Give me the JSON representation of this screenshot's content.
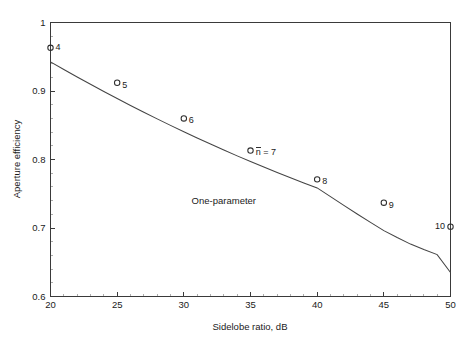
{
  "chart_data": {
    "type": "scatter",
    "title": "",
    "xlabel": "Sidelobe ratio, dB",
    "ylabel": "Aperture efficiency",
    "xlim": [
      20,
      50
    ],
    "ylim": [
      0.6,
      1.0
    ],
    "grid": false,
    "legend": "none",
    "x_ticks": [
      {
        "value": 20,
        "label": "20"
      },
      {
        "value": 25,
        "label": "25"
      },
      {
        "value": 30,
        "label": "30"
      },
      {
        "value": 35,
        "label": "35"
      },
      {
        "value": 40,
        "label": "40"
      },
      {
        "value": 45,
        "label": "45"
      },
      {
        "value": 50,
        "label": "50"
      }
    ],
    "y_ticks": [
      {
        "value": 0.6,
        "label": "0.6"
      },
      {
        "value": 0.7,
        "label": "0.7"
      },
      {
        "value": 0.8,
        "label": "0.8"
      },
      {
        "value": 0.9,
        "label": "0.9"
      },
      {
        "value": 1.0,
        "label": "1"
      }
    ],
    "x_minor_tick_step": 1,
    "y_minor_tick_step": 0.02,
    "series": [
      {
        "name": "Taylor n-bar designs",
        "type": "scatter",
        "marker": "open-circle",
        "x": [
          20,
          25,
          30,
          35,
          40,
          45,
          50
        ],
        "values": [
          0.963,
          0.912,
          0.86,
          0.813,
          0.771,
          0.737,
          0.702
        ],
        "point_labels": [
          "4",
          "5",
          "6",
          "7",
          "8",
          "9",
          "10"
        ],
        "point_label_positions": [
          "right",
          "right",
          "right",
          "right",
          "right",
          "right",
          "left"
        ]
      },
      {
        "name": "One-parameter",
        "type": "line",
        "marker": "none",
        "x": [
          20,
          21,
          22,
          23,
          24,
          25,
          26,
          27,
          28,
          29,
          30,
          31,
          32,
          33,
          34,
          35,
          36,
          37,
          38,
          39,
          40,
          41,
          42,
          43,
          44,
          45,
          46,
          47,
          48,
          49,
          50
        ],
        "values": [
          0.9425,
          0.9314,
          0.9205,
          0.9098,
          0.8993,
          0.889,
          0.8789,
          0.869,
          0.8593,
          0.8498,
          0.8405,
          0.8314,
          0.8225,
          0.8138,
          0.8053,
          0.797,
          0.7889,
          0.781,
          0.7733,
          0.7658,
          0.7585,
          0.7458,
          0.733,
          0.7205,
          0.7082,
          0.6962,
          0.686,
          0.6765,
          0.6685,
          0.6612,
          0.635
        ]
      }
    ],
    "annotations": [
      {
        "text": "One-parameter",
        "x": 33.0,
        "y": 0.7345,
        "name": "one-parameter-curve-label"
      },
      {
        "text": "n = 7",
        "overbar_on": "n",
        "x": 35.4,
        "y": 0.8065,
        "name": "n-bar-equals-7-label"
      }
    ]
  }
}
